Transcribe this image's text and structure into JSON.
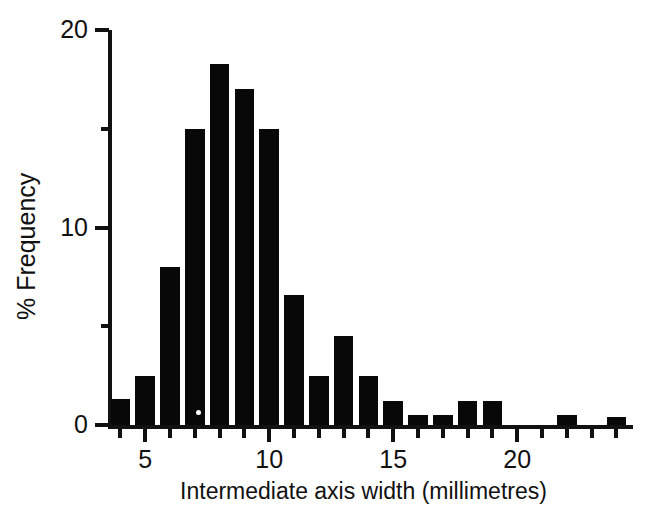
{
  "figure": {
    "caption": ""
  },
  "chart_data": {
    "type": "bar",
    "title": "",
    "subtitle": "",
    "xlabel": "Intermediate axis width (millimetres)",
    "ylabel": "% Frequency",
    "xlim": [
      3.5,
      24.5
    ],
    "ylim": [
      0,
      20
    ],
    "grid": false,
    "legend": null,
    "x_ticks_major": [
      5,
      10,
      15,
      20
    ],
    "x_tick_labels": [
      "5",
      "10",
      "15",
      "20"
    ],
    "x_ticks_minor": [
      4,
      6,
      7,
      8,
      9,
      11,
      12,
      13,
      14,
      16,
      17,
      18,
      19,
      21,
      22,
      23,
      24
    ],
    "y_ticks_major": [
      0,
      10,
      20
    ],
    "y_tick_labels": [
      "0",
      "10",
      "20"
    ],
    "y_ticks_minor": [
      5,
      15
    ],
    "bar_width_mm": 1,
    "categories": [
      4,
      5,
      6,
      7,
      8,
      9,
      10,
      11,
      12,
      13,
      14,
      15,
      16,
      17,
      18,
      19,
      20,
      21,
      22,
      23,
      24
    ],
    "values": [
      1.3,
      2.5,
      8.0,
      15.0,
      18.3,
      17.0,
      15.0,
      6.6,
      2.5,
      4.5,
      2.5,
      1.2,
      0.5,
      0.5,
      1.2,
      1.2,
      0,
      0,
      0.5,
      0,
      0.4
    ],
    "bar_color": "#080808",
    "axis_color": "#111111"
  }
}
